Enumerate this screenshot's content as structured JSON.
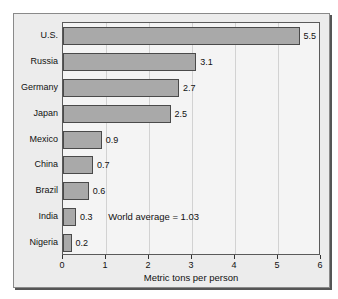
{
  "chart_data": {
    "type": "bar",
    "orientation": "horizontal",
    "title": "",
    "xlabel": "Metric tons per person",
    "ylabel": "",
    "categories": [
      "U.S.",
      "Russia",
      "Germany",
      "Japan",
      "Mexico",
      "China",
      "Brazil",
      "India",
      "Nigeria"
    ],
    "values": [
      5.5,
      3.1,
      2.7,
      2.5,
      0.9,
      0.7,
      0.6,
      0.3,
      0.2
    ],
    "value_labels": [
      "5.5",
      "3.1",
      "2.7",
      "2.5",
      "0.9",
      "0.7",
      "0.6",
      "0.3",
      "0.2"
    ],
    "xlim": [
      0,
      6
    ],
    "xticks": [
      0,
      1,
      2,
      3,
      4,
      5,
      6
    ],
    "xtick_labels": [
      "0",
      "1",
      "2",
      "3",
      "4",
      "5",
      "6"
    ],
    "grid": true,
    "legend": "none",
    "annotations": [
      {
        "text": "World average = 1.03",
        "x": 1.05,
        "category_index": 7
      }
    ],
    "colors": {
      "bar_fill": "#a9a9a9",
      "bar_edge": "#4a4a4a",
      "plot_background": "#f4f4f4",
      "figure_background": "#ececec",
      "gridline": "#d2d2d2",
      "text": "#111111"
    }
  }
}
